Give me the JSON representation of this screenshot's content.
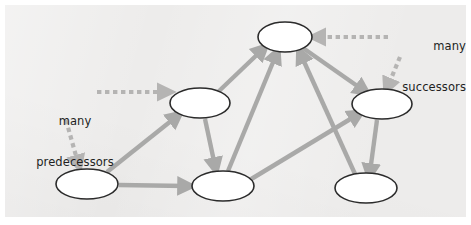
{
  "figure": {
    "type": "directed-graph-diagram",
    "background_color": "#edeceb",
    "page_color": "#ffffff",
    "node_fill": "#ffffff",
    "node_stroke": "#2b2b2b",
    "edge_color": "#a9a9a8",
    "dashed_edge_color": "#b5b4b3",
    "text_color": "#221f1e"
  },
  "annotations": {
    "predecessors": {
      "line1": "many",
      "line2": "predecessors"
    },
    "successors": {
      "line1": "many",
      "line2": "successors"
    }
  },
  "graph_data": {
    "type": "diagram",
    "directed": true,
    "nodes": [
      {
        "id": "n-top",
        "cx": 285,
        "cy": 37,
        "rx": 27,
        "ry": 15
      },
      {
        "id": "n-mid-left",
        "cx": 200,
        "cy": 103,
        "rx": 30,
        "ry": 15
      },
      {
        "id": "n-right-mid",
        "cx": 382,
        "cy": 104,
        "rx": 30,
        "ry": 15
      },
      {
        "id": "n-bottom-left",
        "cx": 87,
        "cy": 184,
        "rx": 31,
        "ry": 15
      },
      {
        "id": "n-bottom-mid",
        "cx": 223,
        "cy": 186,
        "rx": 31,
        "ry": 15
      },
      {
        "id": "n-bottom-right",
        "cx": 366,
        "cy": 188,
        "rx": 31,
        "ry": 15
      }
    ],
    "edges": [
      {
        "from": "n-bottom-left",
        "to": "n-mid-left",
        "style": "solid"
      },
      {
        "from": "n-bottom-left",
        "to": "n-bottom-mid",
        "style": "solid"
      },
      {
        "from": "n-mid-left",
        "to": "n-top",
        "style": "solid"
      },
      {
        "from": "n-mid-left",
        "to": "n-bottom-mid",
        "style": "solid"
      },
      {
        "from": "n-bottom-mid",
        "to": "n-top",
        "style": "solid"
      },
      {
        "from": "n-bottom-mid",
        "to": "n-right-mid",
        "style": "solid"
      },
      {
        "from": "n-bottom-right",
        "to": "n-top",
        "style": "solid"
      },
      {
        "from": "n-top",
        "to": "n-right-mid",
        "style": "solid"
      },
      {
        "from": "n-right-mid",
        "to": "n-bottom-right",
        "style": "solid"
      }
    ],
    "annotation_edges": [
      {
        "label": "predecessors",
        "to": "n-mid-left",
        "style": "dashed",
        "direction": "right"
      },
      {
        "label": "predecessors",
        "to": "n-bottom-left",
        "style": "dashed",
        "direction": "down"
      },
      {
        "label": "successors",
        "to": "n-top",
        "style": "dashed",
        "direction": "left"
      },
      {
        "label": "successors",
        "to": "n-right-mid",
        "style": "dashed",
        "direction": "down"
      }
    ]
  }
}
